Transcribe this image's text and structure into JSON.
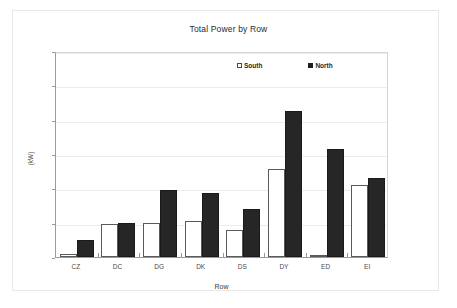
{
  "chart_data": {
    "type": "bar",
    "title": "Total Power by Row",
    "xlabel": "Row",
    "ylabel": "(kW)",
    "categories": [
      "CZ",
      "DC",
      "DG",
      "DK",
      "DS",
      "DY",
      "ED",
      "EI"
    ],
    "series": [
      {
        "name": "South",
        "color": "#ffffff",
        "values": [
          2,
          19,
          20,
          21,
          16,
          51,
          1,
          42
        ]
      },
      {
        "name": "North",
        "color": "#262626",
        "values": [
          10,
          20,
          39,
          37.5,
          28,
          85,
          63,
          46
        ]
      }
    ],
    "ylim": [
      0,
      120
    ],
    "yticks": [
      0,
      20,
      40,
      60,
      80,
      100,
      120
    ],
    "grid": true,
    "legend_position": "top-right"
  },
  "legend": {
    "entries": [
      {
        "label": "South",
        "swatch": "hollow-square-icon"
      },
      {
        "label": "North",
        "swatch": "filled-square-icon"
      }
    ]
  }
}
